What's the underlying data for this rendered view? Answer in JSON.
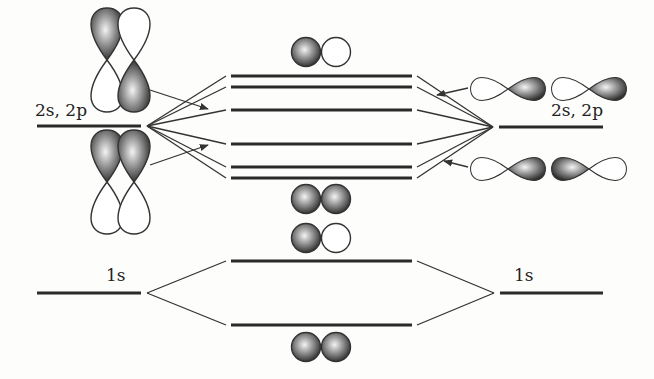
{
  "diagram": {
    "left_atom": {
      "labels": {
        "valence": "2s, 2p",
        "core": "1s"
      }
    },
    "right_atom": {
      "labels": {
        "valence": "2s, 2p",
        "core": "1s"
      }
    },
    "molecular_orbitals": {
      "valence_levels_count": 6,
      "core_levels_count": 2
    },
    "orbital_pictograms": [
      {
        "position": "top-left",
        "type": "p-orbital vertical pair",
        "shading": "opposite phases"
      },
      {
        "position": "bottom-left",
        "type": "p-orbital vertical pair",
        "shading": "same phase"
      },
      {
        "position": "top-right",
        "type": "p-orbital horizontal pair",
        "shading": "same phase"
      },
      {
        "position": "bottom-right",
        "type": "p-orbital horizontal pair",
        "shading": "opposite phases"
      },
      {
        "position": "center-top",
        "type": "s-orbital pair",
        "shading": "antibonding"
      },
      {
        "position": "center-middle-upper",
        "type": "s-orbital pair",
        "shading": "bonding"
      },
      {
        "position": "center-middle-lower",
        "type": "s-orbital pair",
        "shading": "antibonding"
      },
      {
        "position": "center-bottom",
        "type": "s-orbital pair",
        "shading": "bonding"
      }
    ],
    "colors": {
      "line": "#2a2a2a",
      "background": "#fdfdfb",
      "shade_dark": "#3a3a3a",
      "shade_light": "#f2f2f2"
    }
  }
}
